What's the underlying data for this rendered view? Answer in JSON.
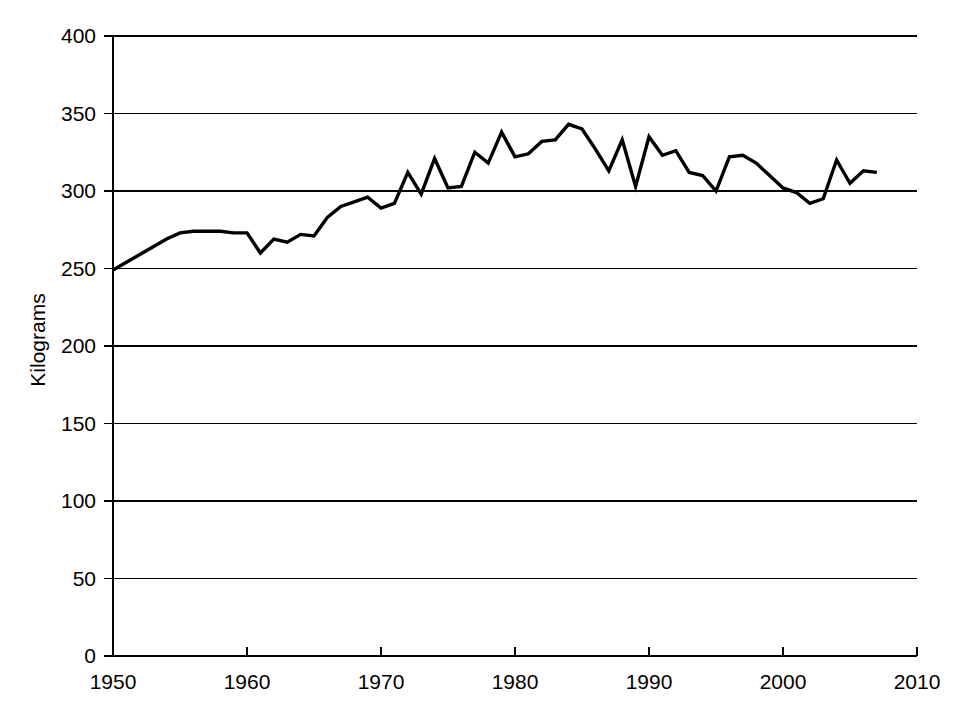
{
  "chart_data": {
    "type": "line",
    "title": "",
    "subtitle": "",
    "xlabel": "",
    "ylabel": "Kilograms",
    "xlim": [
      1950,
      2010
    ],
    "ylim": [
      0,
      400
    ],
    "xticks": [
      1950,
      1960,
      1970,
      1980,
      1990,
      2000,
      2010
    ],
    "yticks": [
      0,
      50,
      100,
      150,
      200,
      250,
      300,
      350,
      400
    ],
    "xtick_labels": [
      "1950",
      "1960",
      "1970",
      "1980",
      "1990",
      "2000",
      "2010"
    ],
    "ytick_labels": [
      "0",
      "50",
      "100",
      "150",
      "200",
      "250",
      "300",
      "350",
      "400"
    ],
    "grid": "horizontal",
    "legend": "none",
    "annotations": [],
    "series": [
      {
        "name": "Kilograms",
        "color": "#000000",
        "x": [
          1950,
          1951,
          1952,
          1953,
          1954,
          1955,
          1956,
          1957,
          1958,
          1959,
          1960,
          1961,
          1962,
          1963,
          1964,
          1965,
          1966,
          1967,
          1968,
          1969,
          1970,
          1971,
          1972,
          1973,
          1974,
          1975,
          1976,
          1977,
          1978,
          1979,
          1980,
          1981,
          1982,
          1983,
          1984,
          1985,
          1986,
          1987,
          1988,
          1989,
          1990,
          1991,
          1992,
          1993,
          1994,
          1995,
          1996,
          1997,
          1998,
          1999,
          2000,
          2001,
          2002,
          2003,
          2004,
          2005,
          2006,
          2007
        ],
        "values": [
          249,
          254,
          259,
          264,
          269,
          273,
          274,
          274,
          274,
          273,
          273,
          260,
          269,
          267,
          272,
          271,
          283,
          290,
          293,
          296,
          289,
          292,
          312,
          298,
          321,
          302,
          303,
          325,
          318,
          338,
          322,
          324,
          332,
          333,
          343,
          340,
          327,
          313,
          333,
          303,
          335,
          323,
          326,
          312,
          310,
          300,
          322,
          323,
          318,
          310,
          302,
          299,
          292,
          295,
          320,
          305,
          313,
          312
        ]
      }
    ]
  },
  "axes": {
    "y_axis_title": "Kilograms"
  }
}
